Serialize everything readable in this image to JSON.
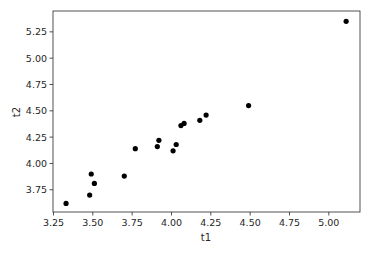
{
  "chart_data": {
    "type": "scatter",
    "title": "",
    "xlabel": "t1",
    "ylabel": "t2",
    "xlim": [
      3.247,
      5.198
    ],
    "ylim": [
      3.539,
      5.448
    ],
    "xticks": [
      3.25,
      3.5,
      3.75,
      4.0,
      4.25,
      4.5,
      4.75,
      5.0
    ],
    "xtick_labels": [
      "3.25",
      "3.50",
      "3.75",
      "4.00",
      "4.25",
      "4.50",
      "4.75",
      "5.00"
    ],
    "yticks": [
      3.75,
      4.0,
      4.25,
      4.5,
      4.75,
      5.0,
      5.25
    ],
    "ytick_labels": [
      "3.75",
      "4.00",
      "4.25",
      "4.50",
      "4.75",
      "5.00",
      "5.25"
    ],
    "grid": false,
    "legend": null,
    "marker_color": "#000000",
    "series": [
      {
        "name": "t2 vs t1",
        "x": [
          3.33,
          3.48,
          3.51,
          3.49,
          3.7,
          3.77,
          3.91,
          3.92,
          4.01,
          4.03,
          4.06,
          4.08,
          4.18,
          4.22,
          4.49,
          5.11
        ],
        "y": [
          3.62,
          3.7,
          3.81,
          3.9,
          3.88,
          4.14,
          4.16,
          4.22,
          4.12,
          4.18,
          4.36,
          4.38,
          4.41,
          4.46,
          4.55,
          5.35
        ]
      }
    ]
  }
}
